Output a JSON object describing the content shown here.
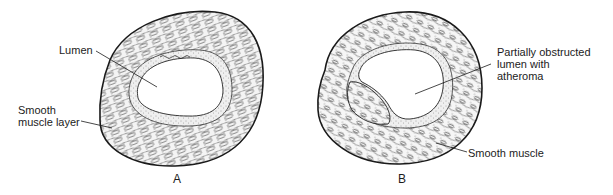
{
  "figure": {
    "panels": [
      {
        "id": "A",
        "letter": "A",
        "labels": {
          "lumen": "Lumen",
          "smooth_muscle_layer": "Smooth\nmuscle layer"
        }
      },
      {
        "id": "B",
        "letter": "B",
        "labels": {
          "obstructed_lumen": "Partially obstructed\nlumen with\natheroma",
          "smooth_muscle": "Smooth muscle"
        }
      }
    ]
  },
  "colors": {
    "ink": "#1a1a1a",
    "background": "#ffffff",
    "stipple": "#555555"
  }
}
